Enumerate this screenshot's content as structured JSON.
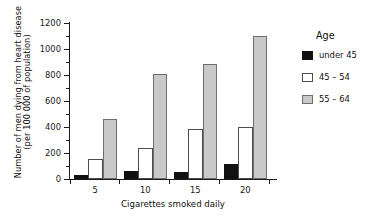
{
  "chart_data": {
    "type": "bar",
    "title": "",
    "xlabel": "Cigarettes smoked daily",
    "ylabel": "Number of men dying from heart disease (per 100 000 of population)",
    "ylabel_lines": [
      "Number of men dying from heart disease",
      "(per 100 000 of population)"
    ],
    "categories": [
      "5",
      "10",
      "15",
      "20"
    ],
    "series": [
      {
        "name": "under 45",
        "color": "#111111",
        "values": [
          30,
          60,
          55,
          115
        ]
      },
      {
        "name": "45 – 54",
        "color": "#ffffff",
        "values": [
          155,
          240,
          385,
          400
        ]
      },
      {
        "name": "55 – 64",
        "color": "#c9c9c9",
        "values": [
          465,
          805,
          885,
          1100
        ]
      }
    ],
    "ylim": [
      0,
      1200
    ],
    "yticks": [
      0,
      200,
      400,
      600,
      800,
      1000,
      1200
    ],
    "ytick_labels": [
      "0",
      "200",
      "400",
      "600",
      "800",
      "1000",
      "1200"
    ],
    "yminor_step": 100,
    "grid": false,
    "legend": {
      "title": "Age",
      "position": "right",
      "entries": [
        {
          "label": "under 45",
          "swatch": "black"
        },
        {
          "label": "45 – 54",
          "swatch": "white"
        },
        {
          "label": "55 – 64",
          "swatch": "gray"
        }
      ]
    }
  }
}
